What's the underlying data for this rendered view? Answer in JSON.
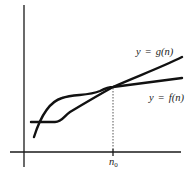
{
  "diagram": {
    "type": "function-comparison",
    "x_axis": {
      "label": "",
      "tick_label_main": "n",
      "tick_label_sub": "0"
    },
    "y_axis": {
      "label": ""
    },
    "curves": [
      {
        "name": "g",
        "label_lhs": "y",
        "label_eq": "=",
        "label_rhs": "g(n)",
        "label_full": "y = g(n)"
      },
      {
        "name": "f",
        "label_lhs": "y",
        "label_eq": "=",
        "label_rhs": "f(n)",
        "label_full": "y = f(n)"
      }
    ],
    "intersection_marker": "n0",
    "colors": {
      "line": "#111111",
      "background": "#ffffff"
    }
  }
}
